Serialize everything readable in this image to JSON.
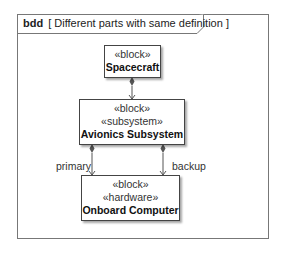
{
  "frame": {
    "kind": "bdd",
    "name": "[ Different parts with same definition ]"
  },
  "blocks": [
    {
      "id": "spacecraft",
      "stereotypes": [
        "«block»"
      ],
      "name": "Spacecraft"
    },
    {
      "id": "avionics",
      "stereotypes": [
        "«block»",
        "«subsystem»"
      ],
      "name": "Avionics Subsystem"
    },
    {
      "id": "onboard",
      "stereotypes": [
        "«block»",
        "«hardware»"
      ],
      "name": "Onboard Computer"
    }
  ],
  "associations": [
    {
      "from": "Spacecraft",
      "to": "Avionics Subsystem",
      "type": "composition",
      "role": ""
    },
    {
      "from": "Avionics Subsystem",
      "to": "Onboard Computer",
      "type": "composition",
      "role": "primary"
    },
    {
      "from": "Avionics Subsystem",
      "to": "Onboard Computer",
      "type": "composition",
      "role": "backup"
    }
  ],
  "colors": {
    "line": "#555555",
    "border": "#444444",
    "background": "#ffffff"
  }
}
